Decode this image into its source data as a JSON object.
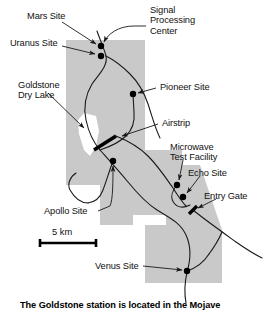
{
  "figure": {
    "caption": "The Goldstone station is located in the Mojave"
  },
  "colors": {
    "station_area_fill": "#c9c9c9",
    "dry_lake_fill": "#ffffff",
    "road_stroke": "#1a1a1a",
    "marker_fill": "#000000",
    "label_text": "#111111",
    "background": "#ffffff"
  },
  "labels": {
    "mars_site": "Mars Site",
    "uranus_site": "Uranus Site",
    "signal_processing_center": "Signal\nProcessing\nCenter",
    "goldstone_dry_lake": "Goldstone\nDry Lake",
    "pioneer_site": "Pioneer Site",
    "airstrip": "Airstrip",
    "microwave_test_facility": "Microwave\nTest Facility",
    "echo_site": "Echo Site",
    "entry_gate": "Entry Gate",
    "apollo_site": "Apollo Site",
    "venus_site": "Venus Site"
  },
  "scale_bar": {
    "label": "5 km",
    "length_km": 5
  },
  "map_features": {
    "site_markers": [
      {
        "name": "Mars Site",
        "x": 101,
        "y": 46
      },
      {
        "name": "Uranus Site",
        "x": 101,
        "y": 56
      },
      {
        "name": "Pioneer Site",
        "x": 133,
        "y": 94
      },
      {
        "name": "Apollo Site",
        "x": 113,
        "y": 161
      },
      {
        "name": "Microwave Test Facility",
        "x": 177,
        "y": 185
      },
      {
        "name": "Echo Site",
        "x": 183,
        "y": 197
      },
      {
        "name": "Venus Site",
        "x": 187,
        "y": 271
      }
    ],
    "gate_markers": [
      {
        "name": "Entry Gate",
        "x": 193,
        "y": 210
      }
    ],
    "airstrip": {
      "x1": 94,
      "y1": 150,
      "x2": 116,
      "y2": 136
    }
  }
}
